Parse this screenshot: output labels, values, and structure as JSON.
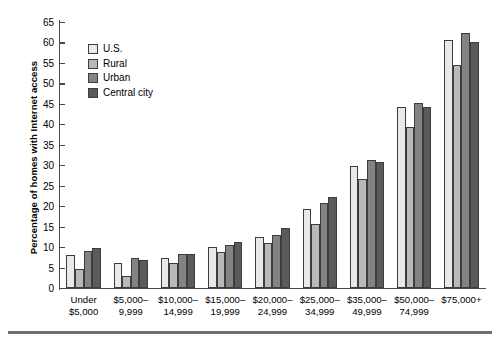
{
  "chart_data": {
    "type": "bar",
    "title": "",
    "subtitle": "",
    "xlabel": "",
    "ylabel": "Percentage of homes with Internet access",
    "ylim": [
      0,
      65
    ],
    "yticks": [
      0,
      5,
      10,
      15,
      20,
      25,
      30,
      35,
      40,
      45,
      50,
      55,
      60,
      65
    ],
    "grid": false,
    "legend_position": "upper-left-inside",
    "categories": [
      "Under\n$5,000",
      "$5,000–\n9,999",
      "$10,000–\n14,999",
      "$15,000–\n19,999",
      "$20,000–\n24,999",
      "$25,000–\n34,999",
      "$35,000–\n49,999",
      "$50,000–\n74,999",
      "$75,000+"
    ],
    "category_lines": [
      [
        "Under",
        "$5,000"
      ],
      [
        "$5,000–",
        "9,999"
      ],
      [
        "$10,000–",
        "14,999"
      ],
      [
        "$15,000–",
        "19,999"
      ],
      [
        "$20,000–",
        "24,999"
      ],
      [
        "$25,000–",
        "34,999"
      ],
      [
        "$35,000–",
        "49,999"
      ],
      [
        "$50,000–",
        "74,999"
      ],
      [
        "$75,000+",
        ""
      ]
    ],
    "series": [
      {
        "name": "U.S.",
        "color": "#e9e9e9",
        "values": [
          8.0,
          6.2,
          7.4,
          10.0,
          12.4,
          19.2,
          29.9,
          44.2,
          60.6
        ]
      },
      {
        "name": "Rural",
        "color": "#b9b9b9",
        "values": [
          4.6,
          2.9,
          6.1,
          8.8,
          11.1,
          15.6,
          26.6,
          39.3,
          54.4
        ]
      },
      {
        "name": "Urban",
        "color": "#838383",
        "values": [
          9.1,
          7.3,
          8.3,
          10.5,
          13.0,
          20.8,
          31.4,
          45.2,
          62.2
        ]
      },
      {
        "name": "Central city",
        "color": "#5b5b5b",
        "values": [
          9.9,
          6.8,
          8.3,
          11.2,
          14.6,
          22.3,
          30.7,
          44.2,
          60.1
        ]
      }
    ]
  },
  "legend": {
    "items": [
      {
        "label": "U.S.",
        "color": "#e9e9e9"
      },
      {
        "label": "Rural",
        "color": "#b9b9b9"
      },
      {
        "label": "Urban",
        "color": "#838383"
      },
      {
        "label": "Central city",
        "color": "#5b5b5b"
      }
    ]
  },
  "axes": {
    "y_title": "Percentage of homes with Internet access",
    "y_tick_labels": [
      "0",
      "5",
      "10",
      "15",
      "20",
      "25",
      "30",
      "35",
      "40",
      "45",
      "50",
      "55",
      "60",
      "65"
    ]
  },
  "colors": {
    "axis": "#4a4a4a",
    "bar_outline": "#3d3d3d",
    "rule": "#6e6e6e",
    "background": "#ffffff"
  }
}
